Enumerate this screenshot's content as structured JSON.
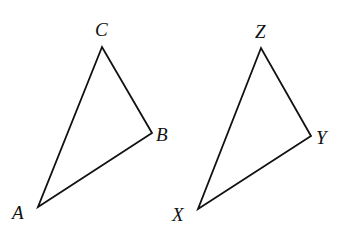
{
  "diagram": {
    "type": "geometry-triangles",
    "triangles": [
      {
        "name": "ABC",
        "vertices": [
          {
            "label": "A",
            "x": 38,
            "y": 207,
            "label_x": 12,
            "label_y": 219
          },
          {
            "label": "B",
            "x": 152,
            "y": 133,
            "label_x": 156,
            "label_y": 141
          },
          {
            "label": "C",
            "x": 102,
            "y": 47,
            "label_x": 95,
            "label_y": 36
          }
        ]
      },
      {
        "name": "XYZ",
        "vertices": [
          {
            "label": "X",
            "x": 198,
            "y": 209,
            "label_x": 172,
            "label_y": 221
          },
          {
            "label": "Y",
            "x": 311,
            "y": 136,
            "label_x": 316,
            "label_y": 144
          },
          {
            "label": "Z",
            "x": 261,
            "y": 48,
            "label_x": 255,
            "label_y": 38
          }
        ]
      }
    ],
    "colors": {
      "stroke": "#111111",
      "background": "#ffffff"
    }
  }
}
